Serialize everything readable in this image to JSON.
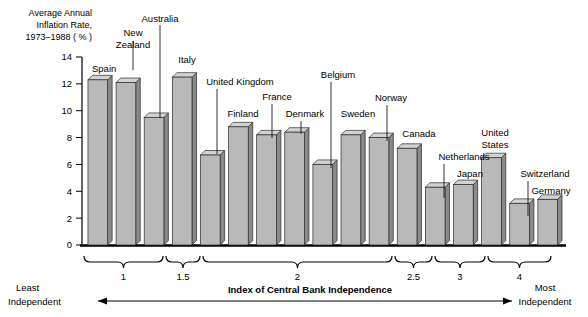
{
  "chart_data": {
    "type": "bar",
    "title_lines": [
      "Average Annual",
      "Inflation Rate,",
      "1973–1988 ( % )"
    ],
    "xlabel": "Index of Central Bank Independence",
    "ylabel": "Average Annual Inflation Rate, 1973-1988 (%)",
    "ylim": [
      0,
      14
    ],
    "ytick_values": [
      0,
      2,
      4,
      6,
      8,
      10,
      12,
      14
    ],
    "ytick_labels": [
      "0",
      "2",
      "4",
      "6",
      "8",
      "10",
      "12",
      "14"
    ],
    "grid": false,
    "legend": "none",
    "categories": [
      "Spain",
      "New Zealand",
      "Australia",
      "Italy",
      "United Kingdom",
      "Finland",
      "France",
      "Denmark",
      "Belgium",
      "Sweden",
      "Norway",
      "Canada",
      "Netherlands",
      "Japan",
      "United States",
      "Switzerland",
      "Germany"
    ],
    "values": [
      12.3,
      12.1,
      9.5,
      12.5,
      6.7,
      8.8,
      8.2,
      8.4,
      6.0,
      8.2,
      8.0,
      7.2,
      4.3,
      4.5,
      6.5,
      3.1,
      3.4
    ],
    "bars": [
      {
        "label": "Spain",
        "label_lines": [
          "Spain"
        ],
        "value": 12.3,
        "label_x": 92,
        "label_y": 72,
        "label_anchor": "start",
        "leader": false
      },
      {
        "label": "New Zealand",
        "label_lines": [
          "New",
          "Zealand"
        ],
        "value": 12.1,
        "label_x": 133,
        "label_y": 36,
        "label_anchor": "middle",
        "leader": true,
        "leader_x": 133,
        "leader_y1": 41,
        "leader_y2": 70
      },
      {
        "label": "Australia",
        "label_lines": [
          "Australia"
        ],
        "value": 9.5,
        "label_x": 160,
        "label_y": 22,
        "label_anchor": "middle",
        "leader": true,
        "leader_x": 160,
        "leader_y1": 25,
        "leader_y2": 118
      },
      {
        "label": "Italy",
        "label_lines": [
          "Italy"
        ],
        "value": 12.5,
        "label_x": 187,
        "label_y": 63,
        "label_anchor": "middle",
        "leader": false
      },
      {
        "label": "United Kingdom",
        "label_lines": [
          "United Kingdom"
        ],
        "value": 6.7,
        "label_x": 240,
        "label_y": 85,
        "label_anchor": "middle",
        "leader": true,
        "leader_x": 217,
        "leader_y1": 89,
        "leader_y2": 154
      },
      {
        "label": "Finland",
        "label_lines": [
          "Finland"
        ],
        "value": 8.8,
        "label_x": 243,
        "label_y": 117,
        "label_anchor": "middle",
        "leader": false
      },
      {
        "label": "France",
        "label_lines": [
          "France"
        ],
        "value": 8.2,
        "label_x": 277,
        "label_y": 100,
        "label_anchor": "middle",
        "leader": true,
        "leader_x": 272,
        "leader_y1": 104,
        "leader_y2": 138
      },
      {
        "label": "Denmark",
        "label_lines": [
          "Denmark"
        ],
        "value": 8.4,
        "label_x": 305,
        "label_y": 117,
        "label_anchor": "middle",
        "leader": true,
        "leader_x": 301,
        "leader_y1": 121,
        "leader_y2": 134
      },
      {
        "label": "Belgium",
        "label_lines": [
          "Belgium"
        ],
        "value": 6.0,
        "label_x": 338,
        "label_y": 78,
        "label_anchor": "middle",
        "leader": true,
        "leader_x": 331,
        "leader_y1": 82,
        "leader_y2": 168
      },
      {
        "label": "Sweden",
        "label_lines": [
          "Sweden"
        ],
        "value": 8.2,
        "label_x": 358,
        "label_y": 117,
        "label_anchor": "middle",
        "leader": false
      },
      {
        "label": "Norway",
        "label_lines": [
          "Norway"
        ],
        "value": 8.0,
        "label_x": 391,
        "label_y": 101,
        "label_anchor": "middle",
        "leader": true,
        "leader_x": 387,
        "leader_y1": 105,
        "leader_y2": 141
      },
      {
        "label": "Canada",
        "label_lines": [
          "Canada"
        ],
        "value": 7.2,
        "label_x": 419,
        "label_y": 137,
        "label_anchor": "middle",
        "leader": false
      },
      {
        "label": "Netherlands",
        "label_lines": [
          "Netherlands"
        ],
        "value": 4.3,
        "label_x": 464,
        "label_y": 160,
        "label_anchor": "middle",
        "leader": true,
        "leader_x": 444,
        "leader_y1": 164,
        "leader_y2": 198
      },
      {
        "label": "Japan",
        "label_lines": [
          "Japan"
        ],
        "value": 4.5,
        "label_x": 470,
        "label_y": 177,
        "label_anchor": "middle",
        "leader": false
      },
      {
        "label": "United States",
        "label_lines": [
          "United",
          "States"
        ],
        "value": 6.5,
        "label_x": 495,
        "label_y": 136,
        "label_anchor": "middle",
        "leader": false
      },
      {
        "label": "Switzerland",
        "label_lines": [
          "Switzerland"
        ],
        "value": 3.1,
        "label_x": 545,
        "label_y": 177,
        "label_anchor": "middle",
        "leader": true,
        "leader_x": 528,
        "leader_y1": 181,
        "leader_y2": 216
      },
      {
        "label": "Germany",
        "label_lines": [
          "Germany"
        ],
        "value": 3.4,
        "label_x": 551,
        "label_y": 194,
        "label_anchor": "middle",
        "leader": false
      }
    ],
    "x_brackets": [
      {
        "label": "1",
        "x1": 84,
        "x2": 163
      },
      {
        "label": "1.5",
        "x1": 166,
        "x2": 200
      },
      {
        "label": "2",
        "x1": 203,
        "x2": 392
      },
      {
        "label": "2.5",
        "x1": 395,
        "x2": 432
      },
      {
        "label": "3",
        "x1": 435,
        "x2": 485
      },
      {
        "label": "4",
        "x1": 488,
        "x2": 551
      }
    ],
    "annotations": {
      "least_independent": [
        "Least",
        "Independent"
      ],
      "most_independent": [
        "Most",
        "Independent"
      ],
      "axis_caption": "Index of Central Bank Independence"
    },
    "colors": {
      "bar_face": "#b9b9b9",
      "bar_side": "#8a8a8a",
      "bar_top": "#d2d2d2",
      "outline": "#2b2b2b",
      "text": "#000000",
      "background": "#ffffff"
    }
  }
}
